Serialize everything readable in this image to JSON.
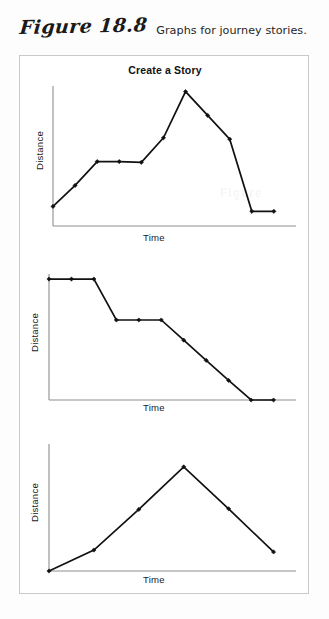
{
  "figure": {
    "number_label": "Figure 18.8",
    "caption": "Graphs for journey stories.",
    "ghost_watermark": "Figure"
  },
  "chart_data": [
    {
      "id": "chart-1",
      "type": "line",
      "title": "Create a Story",
      "xlabel": "Time",
      "ylabel": "Distance",
      "grid": false,
      "legend": "none",
      "xlim": [
        0,
        11
      ],
      "ylim": [
        0,
        10
      ],
      "x": [
        0,
        1,
        2,
        3,
        4,
        5,
        6,
        7,
        8,
        9,
        10
      ],
      "values": [
        1.4,
        2.9,
        4.6,
        4.6,
        4.55,
        6.3,
        9.6,
        7.9,
        6.2,
        1.05,
        1.05
      ],
      "markers": "diamond",
      "notes": "Rises, plateaus, climbs to a peak, then steps down to a low plateau."
    },
    {
      "id": "chart-2",
      "type": "line",
      "title": "",
      "xlabel": "Time",
      "ylabel": "Distance",
      "grid": false,
      "legend": "none",
      "xlim": [
        0,
        11
      ],
      "ylim": [
        0,
        10
      ],
      "x": [
        0,
        1,
        2,
        3,
        4,
        5,
        6,
        7,
        8,
        9,
        10
      ],
      "values": [
        9.6,
        9.6,
        9.6,
        6.35,
        6.35,
        6.35,
        4.75,
        3.15,
        1.55,
        0.0,
        0.0
      ],
      "markers": "diamond",
      "notes": "Descending staircase: high plateau, drop, mid plateau, steady decline to zero."
    },
    {
      "id": "chart-3",
      "type": "line",
      "title": "",
      "xlabel": "Time",
      "ylabel": "Distance",
      "grid": false,
      "legend": "none",
      "xlim": [
        0,
        11
      ],
      "ylim": [
        0,
        10
      ],
      "x": [
        0,
        2,
        4,
        6,
        8,
        10
      ],
      "values": [
        0.0,
        1.65,
        4.85,
        8.2,
        4.9,
        1.5
      ],
      "markers": "diamond",
      "notes": "Single rise to a peak then a symmetric fall."
    }
  ],
  "colors": {
    "line": "#111111",
    "marker": "#111111",
    "axis": "#8d8d8d",
    "frame_border": "#c9c9c9",
    "text": "#1a1a1a",
    "page_background": "#fdfdfd"
  }
}
